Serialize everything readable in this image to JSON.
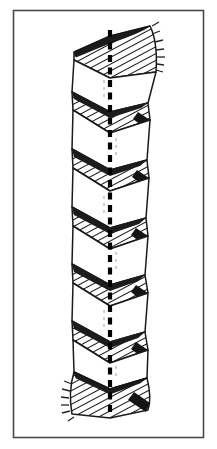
{
  "figure": {
    "kind": "line-drawing",
    "title": "Twisted band with dashed central axis",
    "description": "Black and white technical line illustration of a continuously twisted ribbon (helicoid band) seen edge-on, with a heavy dashed vertical axis running through its centre. Hatched faces alternate with blank faces down the length of the band; both ends flare outward into broad hatched trumpet shapes.",
    "caption": "",
    "label": "",
    "has_text_labels": false
  },
  "frame": {
    "x": 13,
    "y": 10,
    "width": 191,
    "height": 428,
    "stroke": "#4a4a4a",
    "stroke_width": 1.6,
    "fill": "#ffffff"
  },
  "canvas": {
    "width": 217,
    "height": 449,
    "background": "#ffffff"
  },
  "colors": {
    "ink": "#111111",
    "outline": "#1a1a1a",
    "hatch": "#161616",
    "axis": "#000000",
    "paper": "#ffffff",
    "frame": "#4a4a4a",
    "tick": "#222222"
  },
  "axis": {
    "name": "central-axis",
    "x": 110,
    "y_top": 30,
    "y_bottom": 416,
    "stroke": "#000000",
    "stroke_width": 4.2,
    "dash_on": 7,
    "dash_off": 5.5,
    "style": "heavy-dashed"
  },
  "band": {
    "name": "twisted-ribbon",
    "left_x": 72,
    "right_x": 149,
    "center_x": 110,
    "top_y": 26,
    "bottom_y": 420,
    "period": 57.5,
    "cycles": 7,
    "slant": 17,
    "outline_width": 1.5,
    "hatch_spacing": 2.9,
    "hatch_angle_deg": 62
  },
  "segments": [
    {
      "index": 0,
      "kind": "flare-top",
      "y_start": 26,
      "y_end": 74,
      "shaded": true,
      "direction": "down-right"
    },
    {
      "index": 1,
      "kind": "blank-face",
      "y_start": 74,
      "y_end": 100,
      "shaded": false,
      "direction": "down-left"
    },
    {
      "index": 2,
      "kind": "hatched-face",
      "y_start": 100,
      "y_end": 131,
      "shaded": true,
      "direction": "down-right"
    },
    {
      "index": 3,
      "kind": "blank-face",
      "y_start": 131,
      "y_end": 158,
      "shaded": false,
      "direction": "down-left"
    },
    {
      "index": 4,
      "kind": "hatched-face",
      "y_start": 158,
      "y_end": 189,
      "shaded": true,
      "direction": "down-right"
    },
    {
      "index": 5,
      "kind": "blank-face",
      "y_start": 189,
      "y_end": 216,
      "shaded": false,
      "direction": "down-left"
    },
    {
      "index": 6,
      "kind": "hatched-face",
      "y_start": 216,
      "y_end": 247,
      "shaded": true,
      "direction": "down-right"
    },
    {
      "index": 7,
      "kind": "blank-face",
      "y_start": 247,
      "y_end": 273,
      "shaded": false,
      "direction": "down-left"
    },
    {
      "index": 8,
      "kind": "hatched-face",
      "y_start": 273,
      "y_end": 304,
      "shaded": true,
      "direction": "down-right"
    },
    {
      "index": 9,
      "kind": "blank-face",
      "y_start": 304,
      "y_end": 330,
      "shaded": false,
      "direction": "down-left"
    },
    {
      "index": 10,
      "kind": "hatched-face",
      "y_start": 330,
      "y_end": 361,
      "shaded": true,
      "direction": "down-right"
    },
    {
      "index": 11,
      "kind": "blank-face",
      "y_start": 361,
      "y_end": 381,
      "shaded": false,
      "direction": "down-left"
    },
    {
      "index": 12,
      "kind": "flare-bottom",
      "y_start": 381,
      "y_end": 420,
      "shaded": true,
      "direction": "down-right"
    }
  ],
  "edge_ticks": {
    "top": {
      "count": 7,
      "side": "right",
      "x": 152,
      "y_start": 36,
      "y_end": 72,
      "length": 7
    },
    "bottom": {
      "count": 6,
      "side": "left",
      "x": 72,
      "y_start": 386,
      "y_end": 414,
      "length": 7
    }
  }
}
